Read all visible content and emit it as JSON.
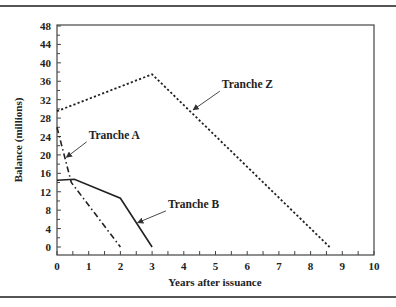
{
  "chart_data": {
    "type": "line",
    "title": "",
    "xlabel": "Years after issuance",
    "ylabel": "Balance (millions)",
    "xlim": [
      0,
      10
    ],
    "ylim": [
      0,
      48
    ],
    "x_ticks": [
      0,
      1,
      2,
      3,
      4,
      5,
      6,
      7,
      8,
      9,
      10
    ],
    "y_ticks": [
      0,
      4,
      8,
      12,
      16,
      20,
      24,
      28,
      32,
      36,
      40,
      44,
      48
    ],
    "grid": false,
    "legend": "inline annotations with arrows",
    "series": [
      {
        "name": "Tranche A",
        "style": "dash-dot",
        "points": [
          [
            0,
            26
          ],
          [
            0.45,
            14
          ],
          [
            2,
            0
          ]
        ],
        "label_pos": [
          1.0,
          23.5
        ],
        "arrow_to": [
          0.3,
          19.5
        ]
      },
      {
        "name": "Tranche B",
        "style": "solid",
        "points": [
          [
            0,
            14.5
          ],
          [
            0.55,
            14.7
          ],
          [
            2,
            10.6
          ],
          [
            3,
            0
          ]
        ],
        "label_pos": [
          3.5,
          8.5
        ],
        "arrow_to": [
          2.55,
          5.3
        ]
      },
      {
        "name": "Tranche Z",
        "style": "dotted",
        "points": [
          [
            0,
            29.5
          ],
          [
            3,
            37.5
          ],
          [
            8.6,
            0
          ]
        ],
        "label_pos": [
          5.2,
          34.5
        ],
        "arrow_to": [
          4.3,
          29.8
        ]
      }
    ]
  }
}
